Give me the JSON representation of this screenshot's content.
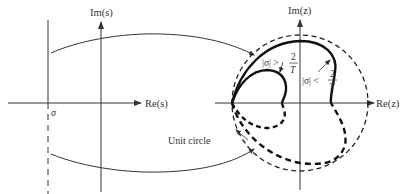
{
  "s_plane": {
    "im_label": "Im(s)",
    "re_label": "Re(s)",
    "sigma_label": "σ"
  },
  "z_plane": {
    "im_label": "Im(z)",
    "re_label": "Re(z)",
    "unit_circle_label": "Unit circle",
    "large_sigma_label": "|σ| >",
    "small_sigma_label": "|σ| <",
    "frac_num": "2",
    "frac_den": "T"
  },
  "colors": {
    "ink": "#333333",
    "curve": "#1a1a1a",
    "background": "#ffffff"
  }
}
